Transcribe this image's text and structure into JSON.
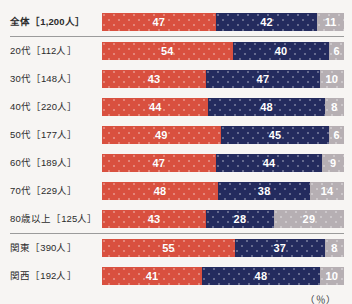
{
  "chart_data": {
    "type": "bar",
    "subtype": "stacked-horizontal-100",
    "title": "",
    "xlabel": "",
    "ylabel": "",
    "unit_note": "（％）",
    "xlim": [
      0,
      100
    ],
    "grid": false,
    "legend_position": "none",
    "categories": [
      "全体［1,200人］",
      "20代［112人］",
      "30代［148人］",
      "40代［220人］",
      "50代［177人］",
      "60代［189人］",
      "70代［229人］",
      "80歳以上［125人］",
      "関東［390人］",
      "関西［192人］"
    ],
    "series": [
      {
        "name": "segment-1",
        "color": "#d9503f",
        "values": [
          47,
          54,
          43,
          44,
          49,
          47,
          48,
          43,
          55,
          41
        ]
      },
      {
        "name": "segment-2",
        "color": "#242b5e",
        "values": [
          42,
          40,
          47,
          48,
          45,
          44,
          38,
          28,
          37,
          48
        ]
      },
      {
        "name": "segment-3",
        "color": "#b6afb3",
        "values": [
          11,
          6,
          10,
          8,
          6,
          9,
          14,
          29,
          8,
          10
        ]
      }
    ]
  },
  "rows": [
    {
      "label": "全体［1,200人］",
      "emphasis": true,
      "divider_after": true,
      "values": [
        47,
        42,
        11
      ]
    },
    {
      "label": "20代［112人］",
      "emphasis": false,
      "divider_after": false,
      "values": [
        54,
        40,
        6
      ]
    },
    {
      "label": "30代［148人］",
      "emphasis": false,
      "divider_after": false,
      "values": [
        43,
        47,
        10
      ]
    },
    {
      "label": "40代［220人］",
      "emphasis": false,
      "divider_after": false,
      "values": [
        44,
        48,
        8
      ]
    },
    {
      "label": "50代［177人］",
      "emphasis": false,
      "divider_after": false,
      "values": [
        49,
        45,
        6
      ]
    },
    {
      "label": "60代［189人］",
      "emphasis": false,
      "divider_after": false,
      "values": [
        47,
        44,
        9
      ]
    },
    {
      "label": "70代［229人］",
      "emphasis": false,
      "divider_after": false,
      "values": [
        48,
        38,
        14
      ]
    },
    {
      "label": "80歳以上［125人］",
      "emphasis": false,
      "divider_after": true,
      "values": [
        43,
        28,
        29
      ]
    },
    {
      "label": "関東［390人］",
      "emphasis": false,
      "divider_after": false,
      "values": [
        55,
        37,
        8
      ]
    },
    {
      "label": "関西［192人］",
      "emphasis": false,
      "divider_after": false,
      "values": [
        41,
        48,
        10
      ]
    }
  ],
  "footer": {
    "unit": "（％）"
  },
  "colors": {
    "segment_1": "#d9503f",
    "segment_2": "#242b5e",
    "segment_3": "#b6afb3",
    "background": "#f7f5f3",
    "divider": "#9b9b9b",
    "label_text": "#2b2b2b"
  }
}
